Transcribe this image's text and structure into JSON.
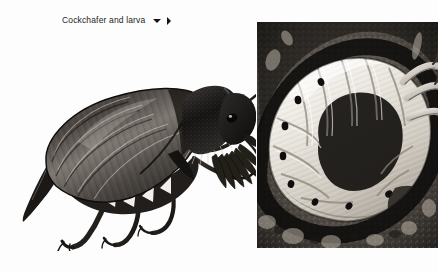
{
  "page": {
    "background_color": "#fdfdfd",
    "width": 438,
    "height": 271
  },
  "caption": {
    "label": "Cockchafer and larva",
    "text_color": "#1c1c1c",
    "collapse_icon": "triangle-down",
    "expand_icon": "triangle-right"
  },
  "figures": [
    {
      "id": "beetle-illustration",
      "type": "engraving-illustration",
      "subject": "Cockchafer beetle (Melolontha melolontha), adult, lateral view",
      "palette": "grayscale",
      "details": [
        "ridged elytra with longitudinal striations",
        "hairy pronotum and thorax",
        "fan-shaped lamellate antennae",
        "white triangular abdominal markings",
        "pointed pygidium",
        "six clawed legs"
      ]
    },
    {
      "id": "larva-photo",
      "type": "photograph",
      "subject": "Cockchafer larva (white grub) curled in soil",
      "palette": "black-and-white",
      "details": [
        "C-shaped body",
        "segmented white abdomen",
        "dark lateral spiracles",
        "three pairs of thoracic legs",
        "dark soil background"
      ]
    }
  ]
}
